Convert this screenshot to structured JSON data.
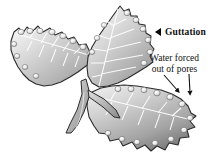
{
  "figure": {
    "background_color": "#ffffff",
    "width": 219,
    "height": 156
  },
  "annotations": {
    "guttation": {
      "label": "Guttation",
      "marker_icon": "left-triangle-pointer-icon",
      "style": "bold",
      "text_color": "#111111"
    },
    "pores": {
      "line1": "Water forced",
      "line2": "out of pores",
      "style": "regular",
      "text_color": "#111111",
      "pointer_icon": "arrow-down-icon",
      "pointer_count": 2
    }
  },
  "illustration": {
    "subject": "leaf",
    "lobe_count": 3,
    "lobes": [
      {
        "name": "left-leaflet",
        "orientation": "upper-left"
      },
      {
        "name": "center-leaflet",
        "orientation": "upward"
      },
      {
        "name": "right-leaflet",
        "orientation": "lower-right"
      }
    ],
    "features": [
      "serrated-margin",
      "pinnate-veins",
      "midrib",
      "petiole",
      "water-droplets"
    ],
    "droplet_count": 26,
    "palette": {
      "leaf_light": "#f2f2f2",
      "leaf_mid": "#c9c9c9",
      "leaf_dark": "#9a9a9a",
      "leaf_shadow": "#6f6f6f",
      "outline": "#2b2b2b",
      "vein": "#ffffff",
      "droplet_light": "#fbfbfb",
      "droplet_shade": "#b4b4b4"
    }
  }
}
